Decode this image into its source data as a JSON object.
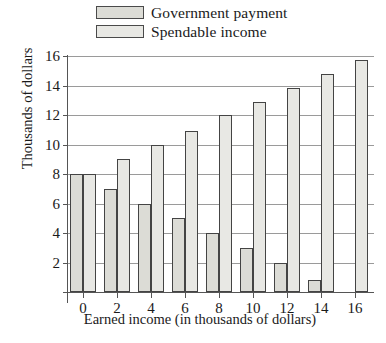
{
  "legend": {
    "items": [
      {
        "label": "Government payment",
        "key": "government_payment",
        "swatch_color": "#dcdcd6"
      },
      {
        "label": "Spendable income",
        "key": "spendable_income",
        "swatch_color": "#e8e8e4"
      }
    ]
  },
  "axes": {
    "y_title": "Thousands of dollars",
    "x_title": "Earned income (in thousands of dollars)",
    "y_ticks": [
      0,
      2,
      4,
      6,
      8,
      10,
      12,
      14,
      16
    ],
    "y_tick_labels": [
      "",
      "2",
      "4",
      "6",
      "8",
      "10",
      "12",
      "14",
      "16"
    ],
    "x_ticks": [
      0,
      2,
      4,
      6,
      8,
      10,
      12,
      14,
      16
    ],
    "x_tick_labels": [
      "0",
      "2",
      "4",
      "6",
      "8",
      "10",
      "12",
      "14",
      "16"
    ]
  },
  "chart_data": {
    "type": "bar",
    "title": "",
    "xlabel": "Earned income (in thousands of dollars)",
    "ylabel": "Thousands of dollars",
    "categories": [
      "0",
      "2",
      "4",
      "6",
      "8",
      "10",
      "12",
      "14",
      "16"
    ],
    "series": [
      {
        "name": "Government payment",
        "values": [
          8,
          7,
          6,
          5,
          4,
          3,
          2,
          0.8,
          0
        ]
      },
      {
        "name": "Spendable income",
        "values": [
          8,
          9,
          10,
          10.9,
          12,
          12.9,
          13.8,
          14.8,
          15.7
        ]
      }
    ],
    "ylim": [
      0,
      16
    ],
    "xlim": [
      -1,
      17
    ],
    "grid": true,
    "legend_position": "top"
  }
}
